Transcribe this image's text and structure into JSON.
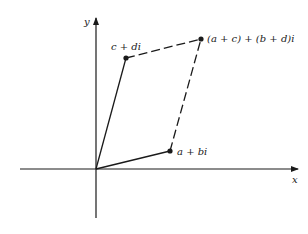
{
  "diagram": {
    "axes": {
      "x_label": "x",
      "y_label": "y"
    },
    "points": {
      "c_di": {
        "label": "c + di",
        "x": 126,
        "y": 58
      },
      "a_bi": {
        "label": "a + bi",
        "x": 170,
        "y": 151
      },
      "sum": {
        "label": "(a + c) + (b + d)i",
        "x": 201,
        "y": 39
      },
      "origin": {
        "x": 96,
        "y": 169
      }
    },
    "colors": {
      "line": "#1a1a1a",
      "background": "#ffffff"
    }
  }
}
